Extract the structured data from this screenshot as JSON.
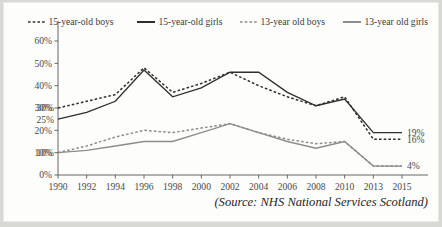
{
  "chart_data": {
    "type": "line",
    "title": "",
    "subtitle": "",
    "xlabel": "",
    "ylabel": "",
    "grid": false,
    "legend_position": "top",
    "x": [
      "1990",
      "1992",
      "1994",
      "1996",
      "1998",
      "2000",
      "2002",
      "2004",
      "2006",
      "2008",
      "2010",
      "2013",
      "2015"
    ],
    "xlim": [
      0,
      12
    ],
    "ylim": [
      0,
      60
    ],
    "y_ticks": [
      "0%",
      "10%",
      "20%",
      "30%",
      "40%",
      "50%",
      "60%"
    ],
    "y_tick_values": [
      0,
      10,
      20,
      30,
      40,
      50,
      60
    ],
    "series": [
      {
        "name": "15-year-old boys",
        "style": "dashed",
        "color": "#2f2f2f",
        "values": [
          30,
          33,
          36,
          48,
          37,
          41,
          46,
          40,
          35,
          31,
          35,
          16,
          16
        ]
      },
      {
        "name": "15-year-old girls",
        "style": "solid",
        "color": "#2f2f2f",
        "values": [
          25,
          28,
          33,
          47,
          35,
          39,
          46,
          46,
          37,
          31,
          34,
          19,
          19
        ]
      },
      {
        "name": "13-year old boys",
        "style": "dashed",
        "color": "#8c8c8c",
        "values": [
          10,
          13,
          17,
          20,
          19,
          21,
          23,
          19,
          16,
          14,
          15,
          4,
          4
        ]
      },
      {
        "name": "13-year old girls",
        "style": "solid",
        "color": "#8c8c8c",
        "values": [
          10,
          11,
          13,
          15,
          15,
          19,
          23,
          19,
          15,
          12,
          15,
          4,
          4
        ]
      }
    ],
    "annotations": [
      {
        "text": "30%",
        "series": "15-year-old boys",
        "x": "1990",
        "value": 30,
        "side": "left"
      },
      {
        "text": "25%",
        "series": "15-year-old girls",
        "x": "1990",
        "value": 25,
        "side": "left"
      },
      {
        "text": "10%",
        "series": "13-year old girls",
        "x": "1990",
        "value": 10,
        "side": "left"
      },
      {
        "text": "19%",
        "series": "15-year-old girls",
        "x": "2015",
        "value": 19,
        "side": "right"
      },
      {
        "text": "16%",
        "series": "15-year-old boys",
        "x": "2015",
        "value": 16,
        "side": "right"
      },
      {
        "text": "4%",
        "series": "13-year old girls",
        "x": "2015",
        "value": 4,
        "side": "right"
      }
    ],
    "source": "(Source: NHS National Services Scotland)"
  },
  "legend": {
    "items": [
      {
        "label": "15-year-old boys",
        "marker": "dashed-line-icon"
      },
      {
        "label": "15-year-old girls",
        "marker": "solid-line-icon"
      },
      {
        "label": "13-year old boys",
        "marker": "dashed-line-icon"
      },
      {
        "label": "13-year old girls",
        "marker": "solid-line-icon"
      }
    ]
  },
  "colors": {
    "age15": "#2f2f2f",
    "age13": "#8c8c8c",
    "axis": "#555555",
    "background": "#fdfdfb",
    "page": "#d8d8d4"
  }
}
